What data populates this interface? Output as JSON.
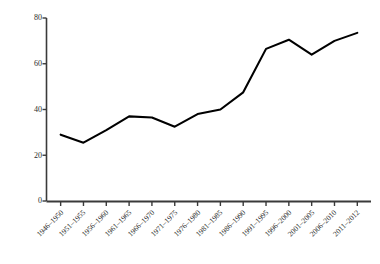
{
  "chart_data": {
    "type": "line",
    "title": "",
    "xlabel": "",
    "ylabel": "Elections per year",
    "categories": [
      "1946–1950",
      "1951–1955",
      "1956–1960",
      "1961–1965",
      "1966–1970",
      "1971–1975",
      "1976–1980",
      "1981–1985",
      "1986–1990",
      "1991–1995",
      "1996–2000",
      "2001–2005",
      "2006–2010",
      "2011–2012"
    ],
    "values": [
      29,
      25.5,
      31,
      37,
      36.5,
      32.5,
      38,
      40,
      47.5,
      66.5,
      70.5,
      64,
      70,
      73.5
    ],
    "ylim": [
      0,
      80
    ],
    "yticks": [
      0,
      20,
      40,
      60,
      80
    ],
    "ytick_labels": [
      "0",
      "20",
      "40",
      "60",
      "80"
    ],
    "grid": false,
    "legend": false,
    "series_color": "#000000",
    "axis_color": "#3a3a3a"
  }
}
